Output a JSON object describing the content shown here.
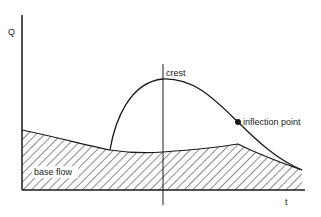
{
  "diagram": {
    "type": "hydrograph",
    "y_axis_label": "Q",
    "x_axis_label": "t",
    "annotations": {
      "crest": "crest",
      "inflection_point": "inflection point",
      "base_flow": "base flow"
    },
    "colors": {
      "line": "#1a1a1a",
      "background": "#ffffff"
    }
  }
}
